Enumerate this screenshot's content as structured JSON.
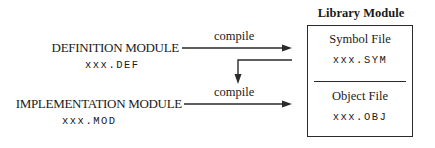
{
  "diagram": {
    "sources": [
      {
        "id": "definition",
        "label": "DEFINITION MODULE",
        "file": "xxx.DEF"
      },
      {
        "id": "implementation",
        "label": "IMPLEMENTATION MODULE",
        "file": "xxx.MOD"
      }
    ],
    "edges": [
      {
        "from": "definition",
        "to": "symbol_file",
        "label": "compile"
      },
      {
        "from": "symbol_file",
        "to": "implementation_compile",
        "label": ""
      },
      {
        "from": "implementation",
        "to": "object_file",
        "label": "compile"
      }
    ],
    "library": {
      "title": "Library Module",
      "sections": [
        {
          "id": "symbol_file",
          "name": "Symbol File",
          "file": "xxx.SYM"
        },
        {
          "id": "object_file",
          "name": "Object File",
          "file": "xxx.OBJ"
        }
      ]
    },
    "colors": {
      "line": "#2a2a2a",
      "text": "#1a1a1a",
      "background": "#ffffff"
    }
  }
}
